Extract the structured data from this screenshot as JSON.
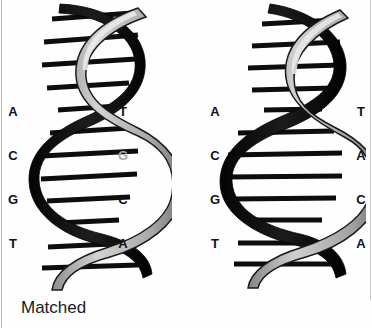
{
  "figure": {
    "background_color": "#fefefe",
    "text_color": "#111111",
    "dim_text_color": "#a8a8a8",
    "width": 372,
    "height": 328
  },
  "panels": [
    {
      "id": "matched",
      "caption": "Matched",
      "strand_left": {
        "label": "template-strand-bases",
        "bases": [
          {
            "letter": "A",
            "state": "normal"
          },
          {
            "letter": "C",
            "state": "normal"
          },
          {
            "letter": "G",
            "state": "normal"
          },
          {
            "letter": "T",
            "state": "normal"
          }
        ]
      },
      "strand_right": {
        "label": "complementary-strand-bases",
        "bases": [
          {
            "letter": "T",
            "state": "normal"
          },
          {
            "letter": "G",
            "state": "dim"
          },
          {
            "letter": "C",
            "state": "normal"
          },
          {
            "letter": "A",
            "state": "normal"
          }
        ]
      },
      "helix": {
        "name": "dna-double-helix-matched",
        "back_ribbon_color": "#121212",
        "front_ribbon_color": "#bdbdbd",
        "rung_color": "#0d0d0d",
        "rung_count": 11
      }
    },
    {
      "id": "mismatched",
      "caption": "Mismatched",
      "strand_left": {
        "label": "template-strand-bases",
        "bases": [
          {
            "letter": "A",
            "state": "normal"
          },
          {
            "letter": "C",
            "state": "normal"
          },
          {
            "letter": "G",
            "state": "normal"
          },
          {
            "letter": "T",
            "state": "normal"
          }
        ]
      },
      "strand_right": {
        "label": "complementary-strand-bases",
        "bases": [
          {
            "letter": "T",
            "state": "normal"
          },
          {
            "letter": "A",
            "state": "normal"
          },
          {
            "letter": "C",
            "state": "normal"
          },
          {
            "letter": "A",
            "state": "normal"
          }
        ]
      },
      "helix": {
        "name": "dna-double-helix-mismatched",
        "back_ribbon_color": "#121212",
        "front_ribbon_color": "#b5b5b5",
        "rung_color": "#0d0d0d",
        "rung_count": 11
      }
    }
  ]
}
